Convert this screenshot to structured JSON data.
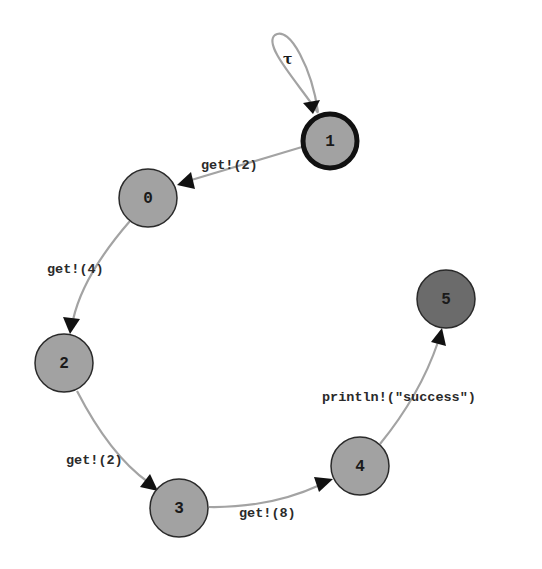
{
  "diagram": {
    "type": "state-transition-graph",
    "colors": {
      "node_fill": "#a2a2a2",
      "final_node_fill": "#6b6b6b",
      "edge": "#a3a3a3",
      "arrow": "#111111",
      "initial_border": "#111111"
    },
    "nodes": [
      {
        "id": "0",
        "label": "0"
      },
      {
        "id": "1",
        "label": "1",
        "initial": true
      },
      {
        "id": "2",
        "label": "2"
      },
      {
        "id": "3",
        "label": "3"
      },
      {
        "id": "4",
        "label": "4"
      },
      {
        "id": "5",
        "label": "5",
        "final": true
      }
    ],
    "edges": [
      {
        "from": "1",
        "to": "1",
        "label": "τ"
      },
      {
        "from": "1",
        "to": "0",
        "label": "get!(2)"
      },
      {
        "from": "0",
        "to": "2",
        "label": "get!(4)"
      },
      {
        "from": "2",
        "to": "3",
        "label": "get!(2)"
      },
      {
        "from": "3",
        "to": "4",
        "label": "get!(8)"
      },
      {
        "from": "4",
        "to": "5",
        "label": "println!(\"success\")"
      }
    ]
  }
}
